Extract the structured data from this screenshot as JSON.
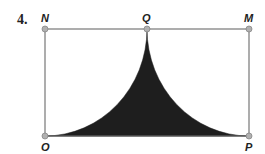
{
  "problem": {
    "number": "4.",
    "points": {
      "N": {
        "label": "N",
        "x": 45,
        "y": 29
      },
      "Q": {
        "label": "Q",
        "x": 147,
        "y": 29
      },
      "M": {
        "label": "M",
        "x": 249,
        "y": 29
      },
      "O": {
        "label": "O",
        "x": 45,
        "y": 136
      },
      "P": {
        "label": "P",
        "x": 249,
        "y": 136
      }
    },
    "shape": "rectangle NMPO with shaded region between two quarter-circle arcs centered at N and M meeting at Q",
    "colors": {
      "outline": "#777777",
      "fill": "#1e1e1e",
      "point": "#b0b0b0"
    }
  }
}
